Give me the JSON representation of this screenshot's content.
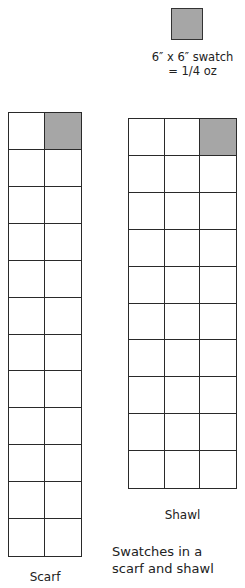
{
  "key": {
    "swatch_label_line1": "6″ x 6″ swatch",
    "swatch_label_line2": "= 1/4 oz",
    "swatch_color": "#a6a6a6"
  },
  "scarf": {
    "label": "Scarf",
    "columns": 2,
    "rows": 12,
    "filled_cell": {
      "row": 0,
      "col": 1
    }
  },
  "shawl": {
    "label": "Shawl",
    "columns": 3,
    "rows": 10,
    "filled_cell": {
      "row": 0,
      "col": 2
    }
  },
  "figure_caption": {
    "line1": "Swatches in a",
    "line2": "scarf and shawl"
  }
}
